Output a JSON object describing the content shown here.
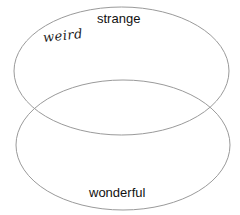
{
  "diagram": {
    "type": "venn",
    "sets": [
      {
        "id": "top",
        "label": "strange",
        "shape": "ellipse",
        "cx": 121.5,
        "cy": 71,
        "rx": 107.5,
        "ry": 64
      },
      {
        "id": "bottom",
        "label": "wonderful",
        "shape": "ellipse",
        "cx": 123,
        "cy": 145,
        "rx": 107,
        "ry": 65
      }
    ],
    "annotations": [
      {
        "text": "weird",
        "style": "handwritten",
        "region": "top-only"
      }
    ],
    "stroke_color": "#9a9a9a",
    "text_color": "#111111"
  }
}
